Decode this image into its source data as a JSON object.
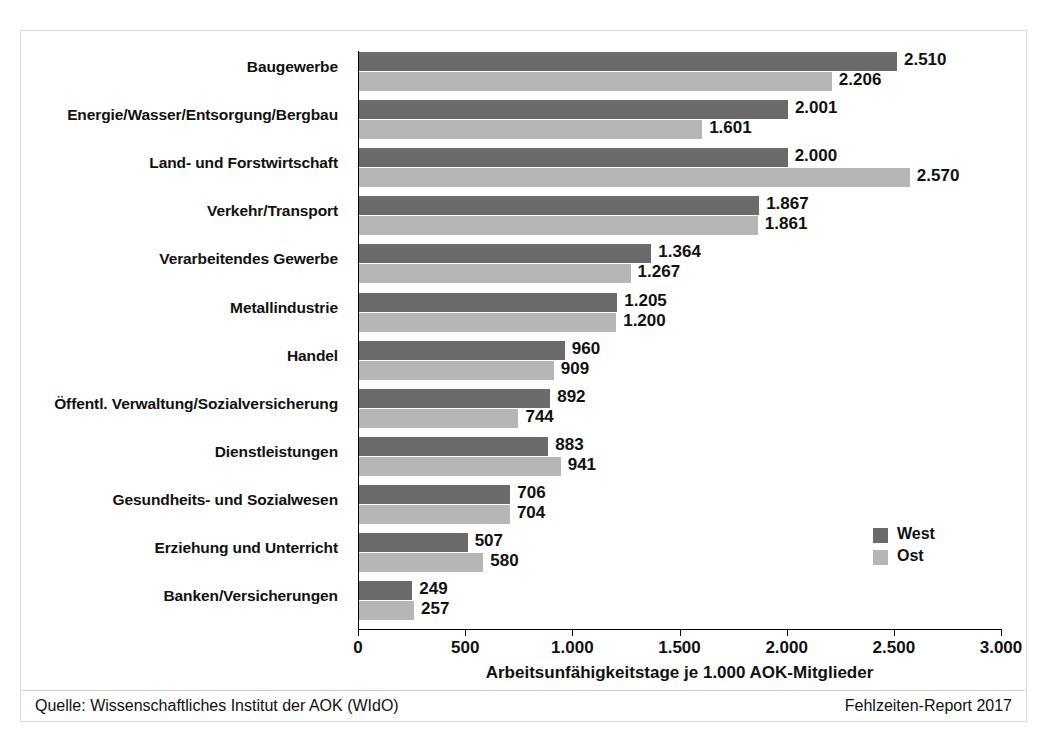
{
  "chart_data": {
    "type": "bar",
    "orientation": "horizontal",
    "title": "",
    "xlabel": "Arbeitsunfähigkeitstage je 1.000 AOK-Mitglieder",
    "ylabel": "",
    "xlim": [
      0,
      3000
    ],
    "xticks": [
      "0",
      "500",
      "1.000",
      "1.500",
      "2.000",
      "2.500",
      "3.000"
    ],
    "xtick_values": [
      0,
      500,
      1000,
      1500,
      2000,
      2500,
      3000
    ],
    "grid": false,
    "legend_position": "right-inside",
    "categories": [
      "Baugewerbe",
      "Energie/Wasser/Entsorgung/Bergbau",
      "Land- und Forstwirtschaft",
      "Verkehr/Transport",
      "Verarbeitendes Gewerbe",
      "Metallindustrie",
      "Handel",
      "Öffentl. Verwaltung/Sozialversicherung",
      "Dienstleistungen",
      "Gesundheits- und Sozialwesen",
      "Erziehung und Unterricht",
      "Banken/Versicherungen"
    ],
    "series": [
      {
        "name": "West",
        "color": "#6b6b6b",
        "values": [
          2510,
          2001,
          2000,
          1867,
          1364,
          1205,
          960,
          892,
          883,
          706,
          507,
          249
        ],
        "labels": [
          "2.510",
          "2.001",
          "2.000",
          "1.867",
          "1.364",
          "1.205",
          "960",
          "892",
          "883",
          "706",
          "507",
          "249"
        ]
      },
      {
        "name": "Ost",
        "color": "#b6b6b6",
        "values": [
          2206,
          1601,
          2570,
          1861,
          1267,
          1200,
          909,
          744,
          941,
          704,
          580,
          257
        ],
        "labels": [
          "2.206",
          "1.601",
          "2.570",
          "1.861",
          "1.267",
          "1.200",
          "909",
          "744",
          "941",
          "704",
          "580",
          "257"
        ]
      }
    ]
  },
  "legend": {
    "items": [
      {
        "label": "West",
        "color": "#6b6b6b"
      },
      {
        "label": "Ost",
        "color": "#b6b6b6"
      }
    ]
  },
  "footer": {
    "source": "Quelle: Wissenschaftliches Institut der AOK (WIdO)",
    "report": "Fehlzeiten-Report 2017"
  }
}
